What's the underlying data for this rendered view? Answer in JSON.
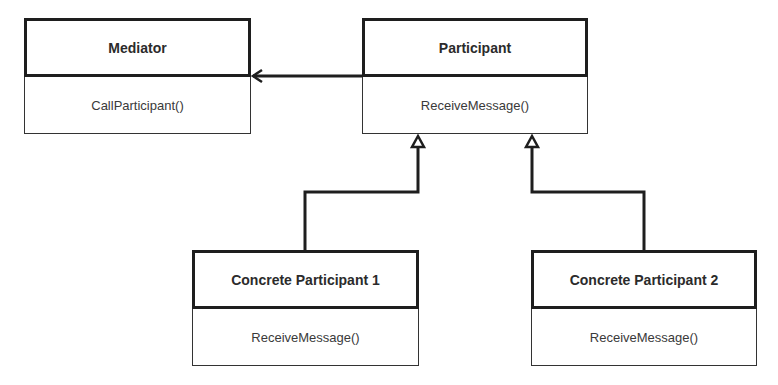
{
  "diagram": {
    "type": "UML class diagram",
    "classes": [
      {
        "id": "mediator",
        "name": "Mediator",
        "methods": [
          "CallParticipant()"
        ]
      },
      {
        "id": "participant",
        "name": "Participant",
        "methods": [
          "ReceiveMessage()"
        ]
      },
      {
        "id": "concrete1",
        "name": "Concrete Participant 1",
        "methods": [
          "ReceiveMessage()"
        ]
      },
      {
        "id": "concrete2",
        "name": "Concrete Participant 2",
        "methods": [
          "ReceiveMessage()"
        ]
      }
    ],
    "relations": [
      {
        "from": "Participant",
        "to": "Mediator",
        "type": "association",
        "arrow": "open"
      },
      {
        "from": "Concrete Participant 1",
        "to": "Participant",
        "type": "generalization",
        "arrow": "hollow-triangle"
      },
      {
        "from": "Concrete Participant 2",
        "to": "Participant",
        "type": "generalization",
        "arrow": "hollow-triangle"
      }
    ]
  },
  "colors": {
    "line": "#1e1e1e",
    "text": "#2b2b2b",
    "background": "#ffffff"
  }
}
